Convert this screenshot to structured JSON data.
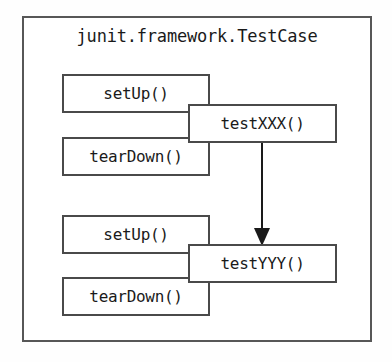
{
  "diagram": {
    "title": "junit.framework.TestCase",
    "type": "class-lifecycle-diagram",
    "background_color": "#ffffff",
    "border_color": "#575757",
    "node_border_color": "#4a4a4a",
    "text_color": "#1a1a1a",
    "arrow_color": "#1a1a1a",
    "lifecycle_nodes": [
      {
        "label": "setUp()",
        "group": 1,
        "x": 62,
        "y": 74
      },
      {
        "label": "tearDown()",
        "group": 1,
        "x": 62,
        "y": 137
      },
      {
        "label": "setUp()",
        "group": 2,
        "x": 62,
        "y": 215
      },
      {
        "label": "tearDown()",
        "group": 2,
        "x": 62,
        "y": 277
      }
    ],
    "test_nodes": [
      {
        "label": "testXXX()",
        "group": 1,
        "x": 188,
        "y": 104
      },
      {
        "label": "testYYY()",
        "group": 2,
        "x": 188,
        "y": 244
      }
    ],
    "connector": {
      "from": "testXXX()",
      "to": "testYYY()",
      "style": "solid-line-filled-arrowhead",
      "x": 262,
      "y_start": 143,
      "y_end": 244
    }
  }
}
